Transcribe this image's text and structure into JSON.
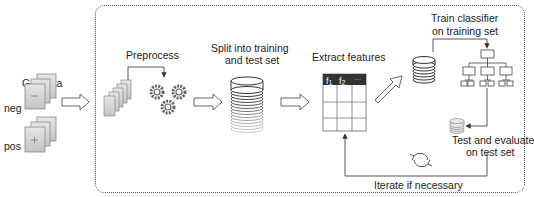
{
  "diagram": {
    "stages": {
      "get_data": {
        "label": "Get data",
        "classes": [
          {
            "label": "neg",
            "symbol": "−"
          },
          {
            "label": "pos",
            "symbol": "+"
          }
        ]
      },
      "preprocess": {
        "label": "Preprocess"
      },
      "split": {
        "label_line1": "Split into training",
        "label_line2": "and test set"
      },
      "extract": {
        "label": "Extract features",
        "table_headers": [
          "f1",
          "f2",
          "···"
        ]
      },
      "train": {
        "label_line1": "Train classifier",
        "label_line2": "on training set"
      },
      "test": {
        "label_line1": "Test and evaluate",
        "label_line2": "on test set"
      },
      "iterate": {
        "label": "Iterate if necessary"
      }
    },
    "colors": {
      "stroke": "#444444",
      "doc_fill": "#d4d4d4",
      "table_header": "#333333",
      "box_border": "#555555"
    }
  }
}
